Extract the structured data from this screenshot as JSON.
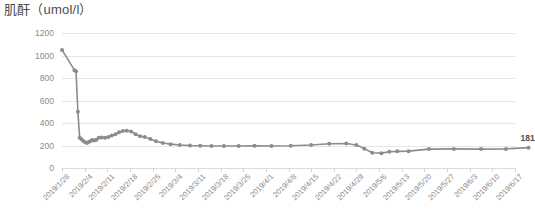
{
  "chart_data": {
    "type": "line",
    "title": "肌酐（umol/l）",
    "xlabel": "",
    "ylabel": "",
    "ylim": [
      0,
      1200
    ],
    "ytick_values": [
      1200,
      1000,
      800,
      600,
      400,
      200,
      0
    ],
    "ytick_labels": [
      "1200",
      "1000",
      "800",
      "600",
      "400",
      "200",
      "0"
    ],
    "grid": true,
    "legend": false,
    "series_color": "#8c8c8c",
    "marker": "circle",
    "tick_labels": [
      "2019/1/28",
      "2019/2/4",
      "2019/2/11",
      "2019/2/18",
      "2019/2/25",
      "2019/3/4",
      "2019/3/11",
      "2019/3/18",
      "2019/3/25",
      "2019/4/1",
      "2019/4/8",
      "2019/4/15",
      "2019/4/22",
      "2019/4/29",
      "2019/5/6",
      "2019/5/13",
      "2019/5/20",
      "2019/5/27",
      "2019/6/3",
      "2019/6/10",
      "2019/6/17"
    ],
    "x": [
      0.0,
      0.55,
      0.62,
      0.7,
      0.78,
      0.86,
      0.94,
      1.02,
      1.1,
      1.18,
      1.26,
      1.34,
      1.42,
      1.52,
      1.62,
      1.75,
      1.9,
      2.05,
      2.2,
      2.36,
      2.52,
      2.68,
      2.86,
      3.05,
      3.25,
      3.45,
      3.65,
      3.9,
      4.15,
      4.45,
      4.8,
      5.2,
      5.65,
      6.1,
      6.6,
      7.15,
      7.8,
      8.5,
      9.25,
      10.1,
      11.0,
      11.8,
      12.55,
      13.0,
      13.35,
      13.7,
      14.1,
      14.45,
      14.8,
      15.3,
      16.2,
      17.3,
      18.5,
      19.6,
      20.6
    ],
    "values": [
      1050,
      870,
      860,
      500,
      270,
      255,
      240,
      228,
      222,
      232,
      240,
      248,
      245,
      252,
      268,
      272,
      270,
      275,
      288,
      300,
      318,
      330,
      332,
      325,
      300,
      282,
      275,
      258,
      238,
      222,
      212,
      205,
      200,
      198,
      196,
      195,
      196,
      198,
      196,
      198,
      205,
      215,
      218,
      205,
      172,
      135,
      132,
      145,
      148,
      150,
      168,
      170,
      168,
      170,
      181
    ],
    "end_label": "181",
    "end_label_value": 181
  }
}
